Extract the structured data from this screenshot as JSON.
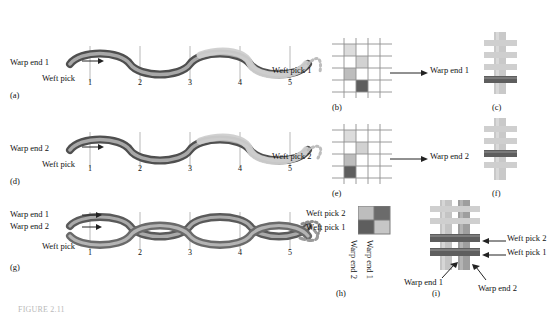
{
  "figure": {
    "caption": "FIGURE 2.11",
    "panels": [
      {
        "tag": "(a)"
      },
      {
        "tag": "(b)"
      },
      {
        "tag": "(c)"
      },
      {
        "tag": "(d)"
      },
      {
        "tag": "(e)"
      },
      {
        "tag": "(f)"
      },
      {
        "tag": "(g)"
      },
      {
        "tag": "(h)"
      },
      {
        "tag": "(i)"
      }
    ],
    "row1": {
      "warp_label": "Warp end 1",
      "weft_label": "Weft pick",
      "pick_numbers": [
        "1",
        "2",
        "3",
        "4",
        "5"
      ],
      "grid_label": "Weft pick 1",
      "grid_arrow_label": "Warp end 1"
    },
    "row2": {
      "warp_label": "Warp end 2",
      "weft_label": "Weft pick",
      "pick_numbers": [
        "1",
        "2",
        "3",
        "4",
        "5"
      ],
      "grid_label": "Weft pick 2",
      "grid_arrow_label": "Warp end 2"
    },
    "row3": {
      "warp_label_1": "Warp end 1",
      "warp_label_2": "Warp end 2",
      "weft_label": "Weft pick",
      "pick_numbers": [
        "1",
        "2",
        "3",
        "4",
        "5"
      ],
      "grid_row_labels": [
        "Weft pick 2",
        "Weft pick 1"
      ],
      "grid_col_labels": [
        "Warp end 2",
        "Warp end 1"
      ],
      "model_labels": [
        "Weft pick 2",
        "Weft pick 1",
        "Warp end 1",
        "Warp end 2"
      ]
    },
    "colors": {
      "dark_yarn": "#5b5b5b",
      "mid_yarn": "#8c8c8c",
      "light_yarn": "#c8c8c8",
      "very_light": "#dcdcdc",
      "grid_line": "#9a9a9a",
      "caption": "#b9b9b9"
    }
  }
}
